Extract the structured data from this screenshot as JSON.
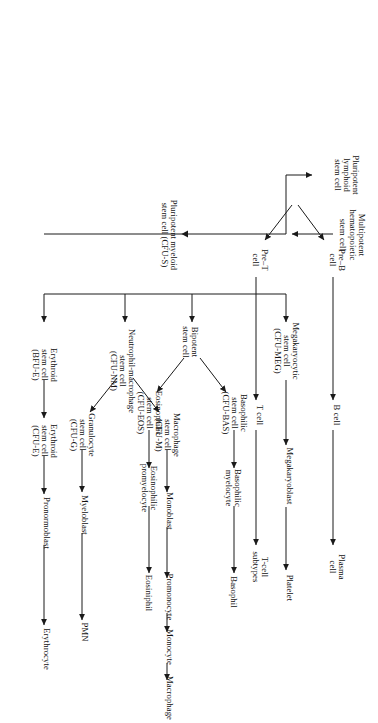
{
  "figure": {
    "kind": "hematopoiesis-flowchart",
    "orientation": "rotated-90-clockwise",
    "background": "#ffffff",
    "line_color": "#1a1a1a",
    "text_color": "#111111"
  },
  "nodes": {
    "multipotent": "Multipotent\nhematopoietic\nstem cell",
    "pluripotent_lymphoid": "Pluripotent\nlymphoid\nstem cell",
    "pluripotent_myeloid": "Pluripotent myeloid\nstem cell (CFU-S)",
    "pre_b": "Pre–B\ncell",
    "b_cell": "B cell",
    "plasma_cell": "Plasma\ncell",
    "pre_t": "Pre–T\ncell",
    "t_cell": "T cell",
    "t_cell_subtypes": "T-cell\nsubtypes",
    "megakaryocytic": "Megakaryocytic\nstem cell\n(CFU-MEG)",
    "megakaryoblast": "Megakaryoblast",
    "platelet": "Platelet",
    "bipotent": "Bipotent\nstem cell",
    "basophilic_stem": "Basophilic\nstem cell\n(CFU-BAS)",
    "basophilic_myelocyte": "Basophilic\nmyelocyte",
    "basophil": "Basophil",
    "eosinophilic_stem": "Eosinophilic\nstem cell\n(CFU-EOS)",
    "eosinophilic_promyelocyte": "Eosinophilic\npromyelocyte",
    "eosiniphil": "Eosiniphil",
    "neutrophil_macrophage": "Neutrophil-macrophage\nstem cell\n(CFU-NM)",
    "macrophage_stem": "Macrophage\nstem cell\n(CFU-M)",
    "monoblast": "Monoblast",
    "promonocyte": "Promonocyte",
    "monocyte": "Monocyte",
    "macrophage": "Macrophage",
    "granulocyte_stem": "Granulocyte\nstem cell\n(CFU-G)",
    "myeloblast": "Myeloblast",
    "pmn": "PMN",
    "erythroid_bfu": "Erythroid\nstem cell\n(BFU-E)",
    "erythroid_cfu": "Erythroid\nstem cell\n(CFU-E)",
    "pronormoblast": "Pronormoblast",
    "erythrocyte": "Erythrocyte"
  },
  "lineages": [
    {
      "name": "lymphoid-b",
      "chain": [
        "Pluripotent lymphoid stem cell",
        "Pre–B cell",
        "B cell",
        "Plasma cell"
      ]
    },
    {
      "name": "lymphoid-t",
      "chain": [
        "Pluripotent lymphoid stem cell",
        "Pre–T cell",
        "T cell",
        "T-cell subtypes"
      ]
    },
    {
      "name": "megakaryocytic",
      "chain": [
        "Pluripotent myeloid stem cell (CFU-S)",
        "Megakaryocytic stem cell (CFU-MEG)",
        "Megakaryoblast",
        "Platelet"
      ]
    },
    {
      "name": "basophilic",
      "chain": [
        "Bipotent stem cell",
        "Basophilic stem cell (CFU-BAS)",
        "Basophilic myelocyte",
        "Basophil"
      ]
    },
    {
      "name": "eosinophilic",
      "chain": [
        "Bipotent stem cell",
        "Eosinophilic stem cell (CFU-EOS)",
        "Eosinophilic promyelocyte",
        "Eosiniphil"
      ]
    },
    {
      "name": "macrophage",
      "chain": [
        "Neutrophil-macrophage stem cell (CFU-NM)",
        "Macrophage stem cell (CFU-M)",
        "Monoblast",
        "Promonocyte",
        "Monocyte",
        "Macrophage"
      ]
    },
    {
      "name": "granulocyte",
      "chain": [
        "Neutrophil-macrophage stem cell (CFU-NM)",
        "Granulocyte stem cell (CFU-G)",
        "Myeloblast",
        "PMN"
      ]
    },
    {
      "name": "erythroid",
      "chain": [
        "Pluripotent myeloid stem cell (CFU-S)",
        "Erythroid stem cell (BFU-E)",
        "Erythroid stem cell (CFU-E)",
        "Pronormoblast",
        "Erythrocyte"
      ]
    }
  ]
}
